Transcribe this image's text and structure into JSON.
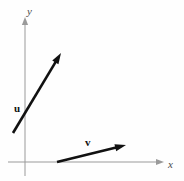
{
  "figure": {
    "background_color": "#fefefe",
    "width": 184,
    "height": 181
  },
  "axes": {
    "color": "#9a9a9a",
    "line_width": 1,
    "origin": {
      "x": 25,
      "y": 162
    },
    "x_axis": {
      "label": "x",
      "label_style": "italic",
      "start": {
        "x": 8,
        "y": 162
      },
      "end": {
        "x": 163,
        "y": 162
      },
      "arrow": "right",
      "label_pos": {
        "x": 168,
        "y": 159
      }
    },
    "y_axis": {
      "label": "y",
      "label_style": "italic",
      "start": {
        "x": 25,
        "y": 176
      },
      "end": {
        "x": 25,
        "y": 18
      },
      "arrow": "up",
      "label_pos": {
        "x": 27,
        "y": 6
      }
    }
  },
  "vectors": [
    {
      "name": "u",
      "label": "u",
      "label_style": "bold",
      "color": "#111111",
      "line_width": 2.6,
      "tail": {
        "x": 13,
        "y": 133
      },
      "tip": {
        "x": 61,
        "y": 53
      },
      "label_pos": {
        "x": 14,
        "y": 103
      },
      "crosses_y_axis": true
    },
    {
      "name": "v",
      "label": "v",
      "label_style": "bold",
      "color": "#111111",
      "line_width": 2.6,
      "tail": {
        "x": 57,
        "y": 162
      },
      "tip": {
        "x": 126,
        "y": 145
      },
      "label_pos": {
        "x": 85,
        "y": 137
      },
      "starts_on_x_axis": true
    }
  ]
}
